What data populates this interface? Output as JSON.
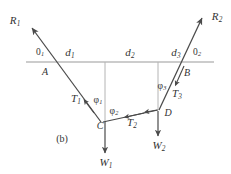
{
  "figure": {
    "caption": "(b)",
    "colors": {
      "line": "#4a4a4a",
      "ground": "#9a9a9a",
      "drop": "#b0b0b0",
      "text": "#333333",
      "background": "#ffffff"
    }
  },
  "points": [
    {
      "id": "A",
      "label": "A",
      "x": 45,
      "y": 72
    },
    {
      "id": "B",
      "label": "B",
      "x": 186,
      "y": 73
    },
    {
      "id": "C",
      "label": "C",
      "x": 100,
      "y": 125
    },
    {
      "id": "D",
      "label": "D",
      "x": 167,
      "y": 112
    }
  ],
  "reactions": [
    {
      "id": "R1",
      "base": "R",
      "sub": "1",
      "x": 15,
      "y": 21
    },
    {
      "id": "R2",
      "base": "R",
      "sub": "2",
      "x": 216,
      "y": 17
    }
  ],
  "tensions": [
    {
      "id": "T1",
      "base": "T",
      "sub": "1",
      "x": 76,
      "y": 98
    },
    {
      "id": "T2",
      "base": "T",
      "sub": "2",
      "x": 131,
      "y": 122
    },
    {
      "id": "T3",
      "base": "T",
      "sub": "3",
      "x": 176,
      "y": 94
    }
  ],
  "weights": [
    {
      "id": "W1",
      "base": "W",
      "sub": "1",
      "x": 106,
      "y": 163
    },
    {
      "id": "W2",
      "base": "W",
      "sub": "2",
      "x": 158,
      "y": 146
    }
  ],
  "spans": [
    {
      "id": "d1",
      "base": "d",
      "sub": "1",
      "x": 70,
      "y": 53
    },
    {
      "id": "d2",
      "base": "d",
      "sub": "2",
      "x": 129,
      "y": 53
    },
    {
      "id": "d3",
      "base": "d",
      "sub": "3",
      "x": 175,
      "y": 53
    }
  ],
  "support_angles": [
    {
      "id": "theta1",
      "base": "0",
      "sub": "1",
      "x": 40,
      "y": 53
    },
    {
      "id": "theta2",
      "base": "0",
      "sub": "2",
      "x": 197,
      "y": 53
    }
  ],
  "cable_angles": [
    {
      "id": "phi1",
      "base": "φ",
      "sub": "1",
      "x": 97,
      "y": 100
    },
    {
      "id": "phi2",
      "base": "φ",
      "sub": "2",
      "x": 113,
      "y": 111
    },
    {
      "id": "phi3",
      "base": "φ",
      "sub": "3",
      "x": 161,
      "y": 86
    }
  ],
  "geometry": {
    "ground_line": {
      "x1": 26,
      "y1": 62,
      "x2": 214,
      "y2": 62
    },
    "drop_lines": [
      {
        "id": "drop-C",
        "x1": 105,
        "y1": 62,
        "x2": 105,
        "y2": 122
      },
      {
        "id": "drop-D",
        "x1": 158,
        "y1": 62,
        "x2": 158,
        "y2": 110
      }
    ],
    "cables": [
      {
        "id": "cable-R1-C",
        "x1": 100,
        "y1": 122,
        "x2": 31,
        "y2": 27,
        "arrow": "end",
        "mid_arrow": true
      },
      {
        "id": "cable-C-D",
        "x1": 158,
        "y1": 110,
        "x2": 102,
        "y2": 122,
        "arrow": "none",
        "mid_arrow": true
      },
      {
        "id": "cable-D-R2",
        "x1": 160,
        "y1": 110,
        "x2": 203,
        "y2": 17,
        "arrow": "end",
        "mid_arrow": true
      }
    ],
    "weight_arrows": [
      {
        "id": "weight-W1",
        "x1": 105,
        "y1": 122,
        "x2": 105,
        "y2": 155
      },
      {
        "id": "weight-W2",
        "x1": 158,
        "y1": 111,
        "x2": 158,
        "y2": 138
      }
    ],
    "down_tick_AB": [
      {
        "id": "tick-A",
        "x1": 52,
        "y1": 62,
        "x2": 90,
        "y2": 114
      }
    ]
  },
  "caption_pos": {
    "x": 62,
    "y": 139
  }
}
